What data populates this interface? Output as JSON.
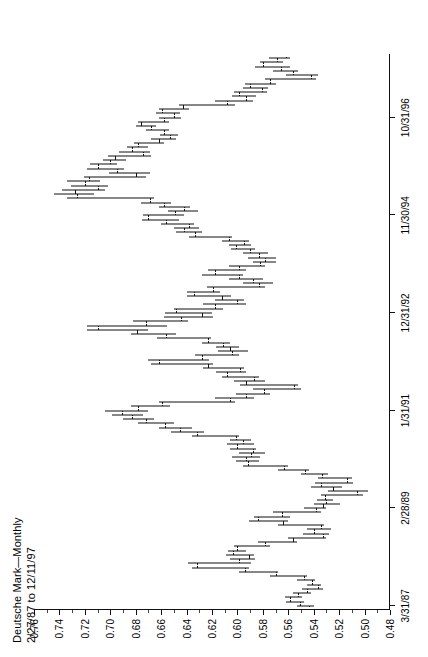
{
  "title": {
    "line1": "Deutsche Mark—Monthly",
    "line2": "2/27/87 to 12/11/97"
  },
  "chart_data": {
    "type": "bar",
    "subtype": "ohlc-bar",
    "title": "Deutsche Mark—Monthly",
    "subtitle": "2/27/87 to 12/11/97",
    "orientation": "page rotated 90° counter-clockwise; value axis printed across the top, time axis printed down the right edge",
    "xlabel": "",
    "ylabel": "",
    "xlim": [
      "1987-03-31",
      "1997-12-11"
    ],
    "ylim": [
      0.48,
      0.76
    ],
    "grid": false,
    "legend": null,
    "ytick_labels": [
      "0.76",
      "0.74",
      "0.72",
      "0.70",
      "0.68",
      "0.66",
      "0.64",
      "0.62",
      "0.60",
      "0.58",
      "0.56",
      "0.54",
      "0.52",
      "0.50",
      "0.48"
    ],
    "ytick_values": [
      0.76,
      0.74,
      0.72,
      0.7,
      0.68,
      0.66,
      0.64,
      0.62,
      0.6,
      0.58,
      0.56,
      0.54,
      0.52,
      0.5,
      0.48
    ],
    "xtick_labels": [
      "3/31/87",
      "2/28/89",
      "1/31/91",
      "12/31/92",
      "11/30/94",
      "10/31/96"
    ],
    "xtick_indices": [
      0,
      23,
      46,
      69,
      92,
      115
    ],
    "series_name": "Deutsche Mark continuous futures (USD per DEM)",
    "columns": [
      "date",
      "open",
      "high",
      "low",
      "close"
    ],
    "bars": [
      [
        "1987-03",
        0.5435,
        0.553,
        0.54,
        0.5505
      ],
      [
        "1987-04",
        0.5505,
        0.562,
        0.548,
        0.5585
      ],
      [
        "1987-05",
        0.5585,
        0.5625,
        0.549,
        0.552
      ],
      [
        "1987-06",
        0.552,
        0.556,
        0.5425,
        0.545
      ],
      [
        "1987-07",
        0.545,
        0.549,
        0.533,
        0.537
      ],
      [
        "1987-08",
        0.537,
        0.5455,
        0.5345,
        0.5415
      ],
      [
        "1987-09",
        0.5415,
        0.553,
        0.539,
        0.548
      ],
      [
        "1987-10",
        0.548,
        0.574,
        0.5455,
        0.57
      ],
      [
        "1987-11",
        0.57,
        0.599,
        0.568,
        0.594
      ],
      [
        "1987-12",
        0.594,
        0.636,
        0.591,
        0.6315
      ],
      [
        "1988-01",
        0.6315,
        0.639,
        0.589,
        0.5985
      ],
      [
        "1988-02",
        0.5985,
        0.606,
        0.586,
        0.591
      ],
      [
        "1988-03",
        0.591,
        0.609,
        0.587,
        0.6035
      ],
      [
        "1988-04",
        0.6035,
        0.6075,
        0.593,
        0.6
      ],
      [
        "1988-05",
        0.6,
        0.603,
        0.574,
        0.578
      ],
      [
        "1988-06",
        0.578,
        0.584,
        0.553,
        0.5565
      ],
      [
        "1988-07",
        0.5565,
        0.56,
        0.53,
        0.5325
      ],
      [
        "1988-08",
        0.5325,
        0.5485,
        0.528,
        0.54
      ],
      [
        "1988-09",
        0.54,
        0.5455,
        0.5265,
        0.534
      ],
      [
        "1988-10",
        0.534,
        0.568,
        0.532,
        0.564
      ],
      [
        "1988-11",
        0.564,
        0.591,
        0.56,
        0.584
      ],
      [
        "1988-12",
        0.584,
        0.587,
        0.559,
        0.565
      ],
      [
        "1989-01",
        0.565,
        0.572,
        0.5345,
        0.5385
      ],
      [
        "1989-02",
        0.5385,
        0.548,
        0.53,
        0.533
      ],
      [
        "1989-03",
        0.533,
        0.54,
        0.5195,
        0.53
      ],
      [
        "1989-04",
        0.53,
        0.5375,
        0.525,
        0.531
      ],
      [
        "1989-05",
        0.531,
        0.534,
        0.5015,
        0.506
      ],
      [
        "1989-06",
        0.506,
        0.529,
        0.4975,
        0.5245
      ],
      [
        "1989-07",
        0.5245,
        0.542,
        0.518,
        0.5345
      ],
      [
        "1989-08",
        0.5345,
        0.539,
        0.509,
        0.514
      ],
      [
        "1989-09",
        0.514,
        0.537,
        0.51,
        0.5335
      ],
      [
        "1989-10",
        0.5335,
        0.55,
        0.529,
        0.547
      ],
      [
        "1989-11",
        0.547,
        0.568,
        0.544,
        0.563
      ],
      [
        "1989-12",
        0.563,
        0.596,
        0.56,
        0.592
      ],
      [
        "1990-01",
        0.592,
        0.601,
        0.583,
        0.593
      ],
      [
        "1990-02",
        0.593,
        0.604,
        0.582,
        0.589
      ],
      [
        "1990-03",
        0.589,
        0.599,
        0.578,
        0.588
      ],
      [
        "1990-04",
        0.588,
        0.606,
        0.5855,
        0.6
      ],
      [
        "1990-05",
        0.6,
        0.608,
        0.587,
        0.596
      ],
      [
        "1990-06",
        0.596,
        0.606,
        0.589,
        0.601
      ],
      [
        "1990-07",
        0.601,
        0.636,
        0.599,
        0.632
      ],
      [
        "1990-08",
        0.632,
        0.652,
        0.626,
        0.645
      ],
      [
        "1990-09",
        0.645,
        0.662,
        0.636,
        0.657
      ],
      [
        "1990-10",
        0.657,
        0.678,
        0.65,
        0.672
      ],
      [
        "1990-11",
        0.672,
        0.69,
        0.666,
        0.683
      ],
      [
        "1990-12",
        0.683,
        0.699,
        0.674,
        0.691
      ],
      [
        "1991-01",
        0.691,
        0.704,
        0.67,
        0.678
      ],
      [
        "1991-02",
        0.678,
        0.684,
        0.653,
        0.659
      ],
      [
        "1991-03",
        0.659,
        0.662,
        0.602,
        0.606
      ],
      [
        "1991-04",
        0.606,
        0.618,
        0.587,
        0.593
      ],
      [
        "1991-05",
        0.593,
        0.601,
        0.574,
        0.579
      ],
      [
        "1991-06",
        0.579,
        0.588,
        0.55,
        0.5555
      ],
      [
        "1991-07",
        0.5555,
        0.598,
        0.552,
        0.593
      ],
      [
        "1991-08",
        0.593,
        0.603,
        0.578,
        0.587
      ],
      [
        "1991-09",
        0.587,
        0.612,
        0.583,
        0.608
      ],
      [
        "1991-10",
        0.608,
        0.617,
        0.593,
        0.598
      ],
      [
        "1991-11",
        0.598,
        0.627,
        0.595,
        0.623
      ],
      [
        "1991-12",
        0.623,
        0.668,
        0.619,
        0.662
      ],
      [
        "1992-01",
        0.662,
        0.67,
        0.622,
        0.628
      ],
      [
        "1992-02",
        0.628,
        0.633,
        0.599,
        0.604
      ],
      [
        "1992-03",
        0.604,
        0.615,
        0.592,
        0.606
      ],
      [
        "1992-04",
        0.606,
        0.617,
        0.599,
        0.611
      ],
      [
        "1992-05",
        0.611,
        0.628,
        0.606,
        0.623
      ],
      [
        "1992-06",
        0.623,
        0.663,
        0.621,
        0.656
      ],
      [
        "1992-07",
        0.656,
        0.684,
        0.648,
        0.679
      ],
      [
        "1992-08",
        0.679,
        0.718,
        0.67,
        0.71
      ],
      [
        "1992-09",
        0.71,
        0.718,
        0.655,
        0.672
      ],
      [
        "1992-10",
        0.672,
        0.682,
        0.639,
        0.644
      ],
      [
        "1992-11",
        0.644,
        0.658,
        0.619,
        0.628
      ],
      [
        "1992-12",
        0.628,
        0.657,
        0.62,
        0.648
      ],
      [
        "1993-01",
        0.648,
        0.65,
        0.611,
        0.618
      ],
      [
        "1993-02",
        0.618,
        0.627,
        0.593,
        0.6
      ],
      [
        "1993-03",
        0.6,
        0.618,
        0.595,
        0.612
      ],
      [
        "1993-04",
        0.612,
        0.64,
        0.605,
        0.634
      ],
      [
        "1993-05",
        0.634,
        0.64,
        0.614,
        0.619
      ],
      [
        "1993-06",
        0.619,
        0.624,
        0.578,
        0.583
      ],
      [
        "1993-07",
        0.583,
        0.596,
        0.572,
        0.588
      ],
      [
        "1993-08",
        0.588,
        0.607,
        0.58,
        0.599
      ],
      [
        "1993-09",
        0.599,
        0.628,
        0.596,
        0.618
      ],
      [
        "1993-10",
        0.618,
        0.623,
        0.593,
        0.599
      ],
      [
        "1993-11",
        0.599,
        0.607,
        0.578,
        0.582
      ],
      [
        "1993-12",
        0.582,
        0.588,
        0.57,
        0.578
      ],
      [
        "1994-01",
        0.578,
        0.592,
        0.57,
        0.583
      ],
      [
        "1994-02",
        0.583,
        0.596,
        0.576,
        0.59
      ],
      [
        "1994-03",
        0.59,
        0.605,
        0.586,
        0.601
      ],
      [
        "1994-04",
        0.601,
        0.607,
        0.589,
        0.595
      ],
      [
        "1994-05",
        0.595,
        0.612,
        0.591,
        0.607
      ],
      [
        "1994-06",
        0.607,
        0.638,
        0.604,
        0.633
      ],
      [
        "1994-07",
        0.633,
        0.648,
        0.628,
        0.642
      ],
      [
        "1994-08",
        0.642,
        0.65,
        0.63,
        0.638
      ],
      [
        "1994-09",
        0.638,
        0.66,
        0.634,
        0.656
      ],
      [
        "1994-10",
        0.656,
        0.675,
        0.646,
        0.67
      ],
      [
        "1994-11",
        0.67,
        0.674,
        0.642,
        0.649
      ],
      [
        "1994-12",
        0.649,
        0.655,
        0.631,
        0.642
      ],
      [
        "1995-01",
        0.642,
        0.662,
        0.637,
        0.658
      ],
      [
        "1995-02",
        0.658,
        0.676,
        0.652,
        0.669
      ],
      [
        "1995-03",
        0.669,
        0.734,
        0.666,
        0.726
      ],
      [
        "1995-04",
        0.726,
        0.744,
        0.713,
        0.728
      ],
      [
        "1995-05",
        0.728,
        0.738,
        0.704,
        0.71
      ],
      [
        "1995-06",
        0.71,
        0.731,
        0.702,
        0.72
      ],
      [
        "1995-07",
        0.72,
        0.734,
        0.708,
        0.717
      ],
      [
        "1995-08",
        0.717,
        0.721,
        0.672,
        0.68
      ],
      [
        "1995-09",
        0.68,
        0.701,
        0.669,
        0.695
      ],
      [
        "1995-10",
        0.695,
        0.718,
        0.689,
        0.71
      ],
      [
        "1995-11",
        0.71,
        0.716,
        0.695,
        0.7
      ],
      [
        "1995-12",
        0.7,
        0.706,
        0.688,
        0.696
      ],
      [
        "1996-01",
        0.696,
        0.702,
        0.668,
        0.674
      ],
      [
        "1996-02",
        0.674,
        0.693,
        0.669,
        0.683
      ],
      [
        "1996-03",
        0.683,
        0.687,
        0.67,
        0.678
      ],
      [
        "1996-04",
        0.678,
        0.681,
        0.658,
        0.662
      ],
      [
        "1996-05",
        0.662,
        0.668,
        0.648,
        0.653
      ],
      [
        "1996-06",
        0.653,
        0.661,
        0.647,
        0.658
      ],
      [
        "1996-07",
        0.658,
        0.672,
        0.654,
        0.668
      ],
      [
        "1996-08",
        0.668,
        0.68,
        0.664,
        0.676
      ],
      [
        "1996-09",
        0.676,
        0.678,
        0.654,
        0.658
      ],
      [
        "1996-10",
        0.658,
        0.662,
        0.644,
        0.65
      ],
      [
        "1996-11",
        0.65,
        0.664,
        0.645,
        0.659
      ],
      [
        "1996-12",
        0.659,
        0.662,
        0.638,
        0.643
      ],
      [
        "1997-01",
        0.643,
        0.646,
        0.602,
        0.608
      ],
      [
        "1997-02",
        0.608,
        0.618,
        0.588,
        0.593
      ],
      [
        "1997-03",
        0.593,
        0.604,
        0.585,
        0.599
      ],
      [
        "1997-04",
        0.599,
        0.603,
        0.577,
        0.581
      ],
      [
        "1997-05",
        0.581,
        0.596,
        0.576,
        0.59
      ],
      [
        "1997-06",
        0.59,
        0.594,
        0.57,
        0.574
      ],
      [
        "1997-07",
        0.574,
        0.578,
        0.538,
        0.542
      ],
      [
        "1997-08",
        0.542,
        0.562,
        0.537,
        0.556
      ],
      [
        "1997-09",
        0.556,
        0.572,
        0.552,
        0.566
      ],
      [
        "1997-10",
        0.566,
        0.586,
        0.559,
        0.58
      ],
      [
        "1997-11",
        0.58,
        0.582,
        0.564,
        0.569
      ],
      [
        "1997-12",
        0.569,
        0.575,
        0.559,
        0.562
      ]
    ]
  }
}
